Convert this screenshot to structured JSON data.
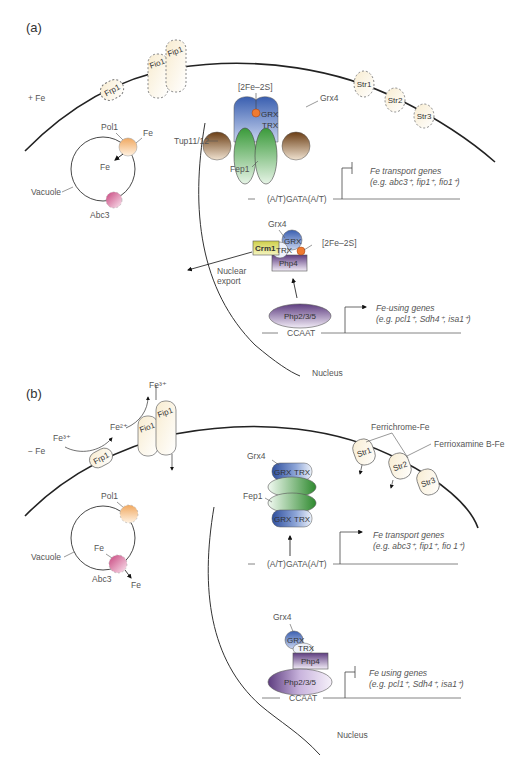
{
  "panels": [
    {
      "id": "a",
      "label": "(a)",
      "condition": "+ Fe",
      "membrane_proteins": [
        "Frp1",
        "Fio1",
        "Fip1",
        "Str1",
        "Str2",
        "Str3"
      ],
      "vacuole": {
        "label": "Vacuole",
        "pol1": "Pol1",
        "abc3": "Abc3",
        "fe_outside": "Fe",
        "fe_inside": "Fe"
      },
      "fep1_complex": {
        "cluster": "[2Fe–2S]",
        "grx4": "Grx4",
        "grx": "GRX",
        "trx": "TRX",
        "tup": "Tup11/12",
        "fep1": "Fep1",
        "motif": "(A/T)GATA(A/T)"
      },
      "transport_genes": {
        "title": "Fe transport genes",
        "examples": "(e.g. abc3⁺, fip1⁺, fio1⁺)"
      },
      "php4_complex": {
        "grx4": "Grx4",
        "crm1": "Crm1",
        "grx": "GRX",
        "trx": "TRX",
        "php4": "Php4",
        "cluster": "[2Fe–2S]",
        "export_label_1": "Nuclear",
        "export_label_2": "export"
      },
      "php235": "Php2/3/5",
      "ccaat": "CCAAT",
      "using_genes": {
        "title": "Fe-using genes",
        "examples": "(e.g. pcl1⁺, Sdh4⁺, isa1⁺)"
      },
      "nucleus": "Nucleus"
    },
    {
      "id": "b",
      "label": "(b)",
      "condition": "− Fe",
      "fe3_in": "Fe³⁺",
      "fe2": "Fe²⁺",
      "fe3_top": "Fe³⁺",
      "membrane_proteins": [
        "Frp1",
        "Fio1",
        "Fip1",
        "Str1",
        "Str2",
        "Str3"
      ],
      "siderophores": [
        "Ferrichrome-Fe",
        "Ferrioxamine B-Fe"
      ],
      "vacuole": {
        "label": "Vacuole",
        "pol1": "Pol1",
        "abc3": "Abc3",
        "fe_inside": "Fe",
        "fe_out": "Fe"
      },
      "fep1_complex": {
        "grx4": "Grx4",
        "fep1": "Fep1",
        "grx": "GRX",
        "trx": "TRX",
        "motif": "(A/T)GATA(A/T)"
      },
      "transport_genes": {
        "title": "Fe transport genes",
        "examples": "(e.g. abc3⁺, fip1⁺, fio 1⁺)"
      },
      "php4_complex": {
        "grx4": "Grx4",
        "grx": "GRX",
        "trx": "TRX",
        "php4": "Php4"
      },
      "php235": "Php2/3/5",
      "ccaat": "CCAAT",
      "using_genes": {
        "title": "Fe using genes",
        "examples": "(e.g. pcl1⁺, Sdh4⁺, isa1⁺)"
      },
      "nucleus": "Nucleus"
    }
  ],
  "colors": {
    "membrane": "#222222",
    "grx_blue": "#3a5fb0",
    "fep1_green": "#3a9a3a",
    "tup_brown": "#7a4a1e",
    "php_purple": "#6b4a8a",
    "crm1_yellow": "#d8d860",
    "pol1_orange": "#f2b070",
    "abc3_pink": "#d86a9a",
    "transporter_cream": "#fbf3de",
    "cluster_orange": "#f07a30"
  }
}
